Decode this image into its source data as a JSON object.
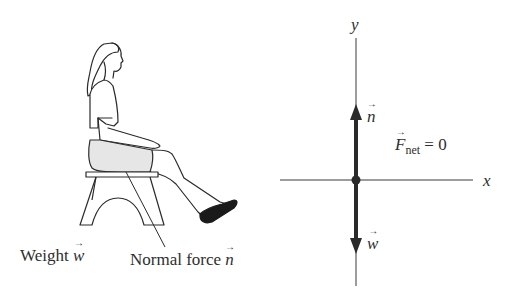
{
  "figure": {
    "left_panel": {
      "description": "Woman seated on a stool with legs extended",
      "labels": {
        "weight_text": "Weight ",
        "weight_symbol": "w",
        "normal_text": "Normal force ",
        "normal_symbol": "n"
      }
    },
    "right_panel": {
      "axes": {
        "x_label": "x",
        "y_label": "y"
      },
      "vectors": [
        {
          "symbol": "n",
          "direction": "up"
        },
        {
          "symbol": "w",
          "direction": "down"
        }
      ],
      "equation": {
        "symbol": "F",
        "subscript": "net",
        "rhs": " = 0"
      }
    },
    "colors": {
      "ink": "#2a2a2a",
      "skirt_fill": "#e6e6e6",
      "shoe": "#1a1a1a",
      "background": "#ffffff"
    }
  }
}
